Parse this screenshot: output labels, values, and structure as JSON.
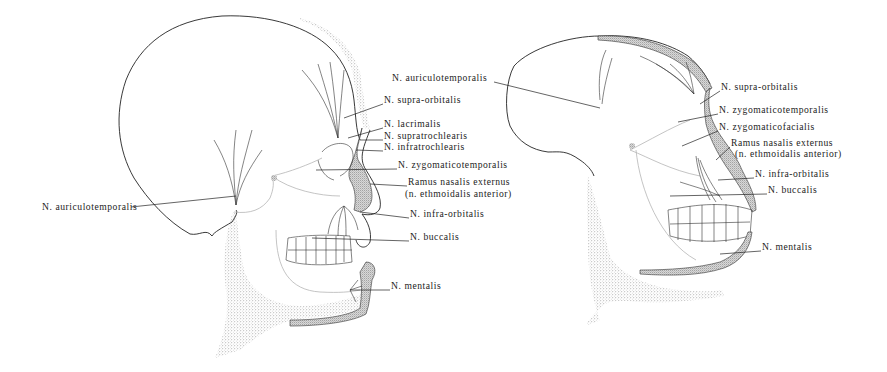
{
  "figure": {
    "type": "anatomical-illustration",
    "panels": [
      {
        "id": "left-skull",
        "subject": "human skull, lateral view",
        "labels": [
          {
            "text": "N. supra-orbitalis",
            "x": 384,
            "y": 100
          },
          {
            "text": "N. lacrimalis",
            "x": 384,
            "y": 124
          },
          {
            "text": "N. supratrochlearis",
            "x": 384,
            "y": 136
          },
          {
            "text": "N. infratrochlearis",
            "x": 384,
            "y": 147
          },
          {
            "text": "N. zygomaticotemporalis",
            "x": 398,
            "y": 165
          },
          {
            "text": "Ramus nasalis externus",
            "x": 408,
            "y": 182
          },
          {
            "text": "(n. ethmoidalis anterior)",
            "x": 405,
            "y": 194
          },
          {
            "text": "N. infra-orbitalis",
            "x": 410,
            "y": 214
          },
          {
            "text": "N. buccalis",
            "x": 410,
            "y": 237
          },
          {
            "text": "N. mentalis",
            "x": 391,
            "y": 286
          },
          {
            "text": "N. auriculotemporalis",
            "x": 42,
            "y": 207
          }
        ]
      },
      {
        "id": "right-skull",
        "subject": "ape skull, lateral view",
        "labels": [
          {
            "text": "N. auriculotemporalis",
            "x": 392,
            "y": 78
          },
          {
            "text": "N. supra-orbitalis",
            "x": 721,
            "y": 87
          },
          {
            "text": "N. zygomaticotemporalis",
            "x": 719,
            "y": 110
          },
          {
            "text": "N. zygomaticofacialis",
            "x": 719,
            "y": 127
          },
          {
            "text": "Ramus nasalis externus",
            "x": 731,
            "y": 143
          },
          {
            "text": "(n. ethmoidalis anterior)",
            "x": 735,
            "y": 154
          },
          {
            "text": "N. infra-orbitalis",
            "x": 755,
            "y": 174
          },
          {
            "text": "N. buccalis",
            "x": 768,
            "y": 190
          },
          {
            "text": "N. mentalis",
            "x": 762,
            "y": 247
          }
        ]
      }
    ],
    "colors": {
      "ink": "#1c1c1c",
      "background": "#ffffff",
      "stipple": "#555555"
    }
  }
}
